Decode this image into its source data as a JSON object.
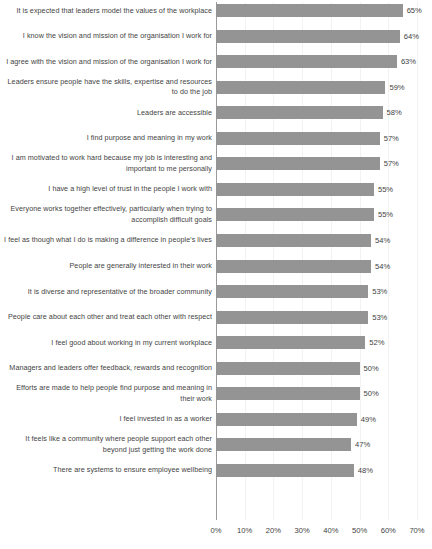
{
  "chart_data": {
    "type": "bar",
    "orientation": "horizontal",
    "title": "",
    "subtitle": "",
    "xlabel": "",
    "ylabel": "",
    "xlim": [
      0,
      70
    ],
    "xticks": [
      "0%",
      "10%",
      "20%",
      "30%",
      "40%",
      "50%",
      "60%",
      "70%"
    ],
    "xtick_values": [
      0,
      10,
      20,
      30,
      40,
      50,
      60,
      70
    ],
    "grid": true,
    "legend": null,
    "bar_color": "#949494",
    "axis_color": "#9a9a9a",
    "gridline_color": "#f2f2f2",
    "value_suffix": "%",
    "categories": [
      "It is expected that leaders model the values of the workplace",
      "I know the vision and mission of the organisation I work for",
      "I agree with the vision and mission of the organisation I work for",
      "Leaders ensure people have the skills, expertise and resources to do the job",
      "Leaders are accessible",
      "I find purpose and meaning in my work",
      "I am motivated to work hard because my job is interesting and important to me personally",
      "I have a high level of trust in the people I work with",
      "Everyone works together effectively, particularly when trying to accomplish difficult goals",
      "I feel as though what I do is making a difference in people's lives",
      "People are generally interested in their work",
      "It is diverse and representative of the broader community",
      "People  care about each other and treat each other with respect",
      "I feel good about working in my current workplace",
      "Managers and leaders offer feedback, rewards and recognition",
      "Efforts are made to help people find purpose and meaning in their work",
      "I feel invested in as a worker",
      "It feels like a community where people support each other beyond just getting the work done",
      "There are systems to ensure employee wellbeing"
    ],
    "values": [
      65,
      64,
      63,
      59,
      58,
      57,
      57,
      55,
      55,
      54,
      54,
      53,
      53,
      52,
      50,
      50,
      49,
      47,
      48
    ],
    "data_labels": [
      "65%",
      "64%",
      "63%",
      "59%",
      "58%",
      "57%",
      "57%",
      "55%",
      "55%",
      "54%",
      "54%",
      "53%",
      "53%",
      "52%",
      "50%",
      "50%",
      "49%",
      "47%",
      "48%"
    ]
  }
}
